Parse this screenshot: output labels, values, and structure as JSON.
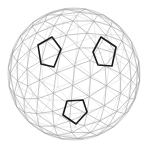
{
  "diagram": {
    "geodesic_frequency": 4,
    "highlighted_pentagons": [
      {
        "name": "upper-left-pentagon",
        "position": "upper-left"
      },
      {
        "name": "upper-right-pentagon",
        "position": "upper-right"
      },
      {
        "name": "bottom-pentagon",
        "position": "bottom-center"
      }
    ],
    "colors": {
      "background": "#ffffff",
      "wireframe": "#9a9a9a",
      "wireframe_back": "#d4d4d4",
      "pentagon": "#1a1a1a"
    }
  }
}
